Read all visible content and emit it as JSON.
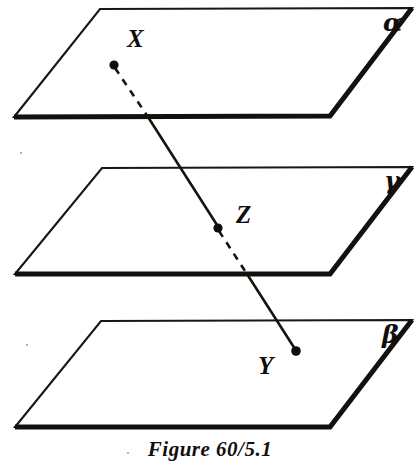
{
  "figure": {
    "caption": "Figure 60/5.1",
    "background_color": "#ffffff",
    "ink_color": "#17130f",
    "planes": [
      {
        "id": "plane-alpha",
        "label": "α",
        "label_name": "alpha",
        "label_x": 383,
        "label_y": 31,
        "points": "100,9 412,8 330,116 14,117",
        "heavy_edge": "14,117 330,116 412,8"
      },
      {
        "id": "plane-gamma",
        "label": "γ",
        "label_name": "gamma",
        "label_x": 384,
        "label_y": 189,
        "points": "102,168 412,167 330,274 15,274",
        "heavy_edge": "15,274 330,274 412,167"
      },
      {
        "id": "plane-beta",
        "label": "β",
        "label_name": "beta",
        "label_x": 382,
        "label_y": 343,
        "points": "101,321 412,320 330,427 15,427",
        "heavy_edge": "15,427 330,427 412,320"
      }
    ],
    "points": [
      {
        "id": "point-x",
        "label": "X",
        "dot_x": 114,
        "dot_y": 65,
        "dot_r": 4.6,
        "label_x": 127,
        "label_y": 47
      },
      {
        "id": "point-z",
        "label": "Z",
        "dot_x": 218,
        "dot_y": 228,
        "dot_r": 4.6,
        "label_x": 236,
        "label_y": 223
      },
      {
        "id": "point-y",
        "label": "Y",
        "dot_x": 296,
        "dot_y": 351,
        "dot_r": 4.8,
        "label_x": 258,
        "label_y": 374
      }
    ],
    "line_segments": [
      {
        "id": "segment-x-to-alpha-edge",
        "style": "dashed",
        "from_x": 115,
        "from_y": 68,
        "to_x": 148,
        "to_y": 117
      },
      {
        "id": "segment-alpha-edge-to-z",
        "style": "solid",
        "from_x": 148,
        "from_y": 117,
        "to_x": 217,
        "to_y": 225
      },
      {
        "id": "segment-z-to-gamma-edge",
        "style": "dashed",
        "from_x": 219,
        "from_y": 231,
        "to_x": 247,
        "to_y": 274
      },
      {
        "id": "segment-gamma-edge-to-y",
        "style": "solid",
        "from_x": 247,
        "from_y": 274,
        "to_x": 295,
        "to_y": 349
      }
    ]
  }
}
